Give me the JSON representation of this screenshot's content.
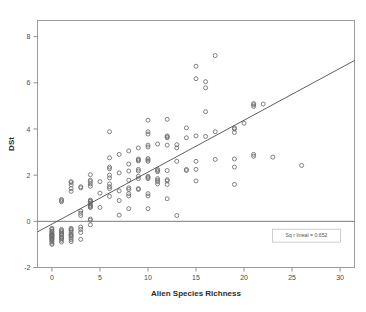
{
  "chart_data": {
    "type": "scatter",
    "title": "",
    "xlabel": "Alien Species Richness",
    "ylabel": "DSt",
    "xlim": [
      -1.5,
      31.5
    ],
    "ylim": [
      -2.0,
      8.7
    ],
    "xticks": [
      0,
      5,
      10,
      15,
      20,
      25,
      30
    ],
    "xtick_labels": [
      "0",
      "5",
      "10",
      "15",
      "20",
      "25",
      "30"
    ],
    "yticks": [
      -2,
      0,
      2,
      4,
      6,
      8
    ],
    "ytick_labels": [
      "-2",
      "0",
      "2",
      "4",
      "6",
      "8"
    ],
    "grid": false,
    "legend": "none",
    "marker": "open-circle",
    "marker_color": "#6b6b6b",
    "reference_line": {
      "orientation": "horizontal",
      "y": 0,
      "color": "#6d6d6d"
    },
    "fit_line": {
      "type": "linear",
      "label": "Sq r lineal = 0.652",
      "r_squared": 0.652,
      "intercept": -0.12,
      "slope": 0.225,
      "x_start": -1.5,
      "x_end": 31.5,
      "color": "#4d4d4d"
    },
    "annotation": {
      "text": "Sq r lineal = 0.652",
      "x": 26.5,
      "y": -0.62
    },
    "points": [
      [
        0,
        -0.35
      ],
      [
        0,
        -0.45
      ],
      [
        0,
        -0.5
      ],
      [
        0,
        -0.55
      ],
      [
        0,
        -0.6
      ],
      [
        0,
        -0.62
      ],
      [
        0,
        -0.68
      ],
      [
        0,
        -0.72
      ],
      [
        0,
        -0.78
      ],
      [
        0,
        -0.82
      ],
      [
        0,
        -0.88
      ],
      [
        0,
        -0.95
      ],
      [
        0,
        -1.0
      ],
      [
        0,
        -0.3
      ],
      [
        0,
        -0.42
      ],
      [
        0,
        -0.58
      ],
      [
        0,
        -0.65
      ],
      [
        0,
        -0.75
      ],
      [
        1,
        -0.35
      ],
      [
        1,
        -0.45
      ],
      [
        1,
        -0.52
      ],
      [
        1,
        -0.6
      ],
      [
        1,
        -0.68
      ],
      [
        1,
        -0.75
      ],
      [
        1,
        -0.82
      ],
      [
        1,
        -0.9
      ],
      [
        1,
        -0.4
      ],
      [
        1,
        -0.55
      ],
      [
        1,
        -0.7
      ],
      [
        1,
        0.9
      ],
      [
        1,
        0.95
      ],
      [
        1,
        0.85
      ],
      [
        2,
        -0.3
      ],
      [
        2,
        -0.4
      ],
      [
        2,
        -0.48
      ],
      [
        2,
        -0.56
      ],
      [
        2,
        -0.64
      ],
      [
        2,
        -0.72
      ],
      [
        2,
        -0.8
      ],
      [
        2,
        -0.88
      ],
      [
        2,
        -0.35
      ],
      [
        2,
        -0.6
      ],
      [
        2,
        1.72
      ],
      [
        2,
        1.68
      ],
      [
        2,
        1.58
      ],
      [
        2,
        1.42
      ],
      [
        2,
        1.3
      ],
      [
        3,
        -0.25
      ],
      [
        3,
        -0.35
      ],
      [
        3,
        -0.48
      ],
      [
        3,
        -0.78
      ],
      [
        3,
        0.25
      ],
      [
        3,
        0.35
      ],
      [
        3,
        0.45
      ],
      [
        3,
        1.45
      ],
      [
        3,
        1.5
      ],
      [
        4,
        -0.15
      ],
      [
        4,
        0.05
      ],
      [
        4,
        0.1
      ],
      [
        4,
        0.6
      ],
      [
        4,
        0.62
      ],
      [
        4,
        0.66
      ],
      [
        4,
        0.7
      ],
      [
        4,
        0.78
      ],
      [
        4,
        0.85
      ],
      [
        4,
        0.88
      ],
      [
        4,
        0.92
      ],
      [
        4,
        1.52
      ],
      [
        4,
        1.62
      ],
      [
        4,
        1.72
      ],
      [
        4,
        1.78
      ],
      [
        4,
        2.02
      ],
      [
        5,
        0.6
      ],
      [
        5,
        1.22
      ],
      [
        5,
        1.72
      ],
      [
        6,
        1.08
      ],
      [
        6,
        1.42
      ],
      [
        6,
        1.5
      ],
      [
        6,
        1.62
      ],
      [
        6,
        1.88
      ],
      [
        6,
        2.0
      ],
      [
        6,
        2.28
      ],
      [
        6,
        2.35
      ],
      [
        6,
        2.75
      ],
      [
        6,
        3.88
      ],
      [
        7,
        0.27
      ],
      [
        7,
        0.9
      ],
      [
        7,
        1.32
      ],
      [
        7,
        2.1
      ],
      [
        7,
        2.9
      ],
      [
        8,
        0.55
      ],
      [
        8,
        1.1
      ],
      [
        8,
        1.2
      ],
      [
        8,
        1.38
      ],
      [
        8,
        1.45
      ],
      [
        8,
        1.78
      ],
      [
        8,
        2.18
      ],
      [
        8,
        2.48
      ],
      [
        8,
        3.05
      ],
      [
        9,
        1.38
      ],
      [
        9,
        1.42
      ],
      [
        9,
        1.85
      ],
      [
        9,
        1.95
      ],
      [
        9,
        2.18
      ],
      [
        9,
        2.25
      ],
      [
        9,
        2.62
      ],
      [
        9,
        2.66
      ],
      [
        9,
        2.7
      ],
      [
        9,
        3.18
      ],
      [
        10,
        0.55
      ],
      [
        10,
        1.1
      ],
      [
        10,
        1.2
      ],
      [
        10,
        1.85
      ],
      [
        10,
        1.9
      ],
      [
        10,
        1.95
      ],
      [
        10,
        2.6
      ],
      [
        10,
        2.66
      ],
      [
        10,
        2.72
      ],
      [
        10,
        3.22
      ],
      [
        10,
        3.3
      ],
      [
        10,
        3.78
      ],
      [
        10,
        3.88
      ],
      [
        10,
        4.38
      ],
      [
        11,
        1.62
      ],
      [
        11,
        1.72
      ],
      [
        11,
        1.78
      ],
      [
        11,
        1.85
      ],
      [
        11,
        2.15
      ],
      [
        11,
        2.2
      ],
      [
        11,
        2.25
      ],
      [
        11,
        3.35
      ],
      [
        12,
        0.98
      ],
      [
        12,
        1.6
      ],
      [
        12,
        1.75
      ],
      [
        12,
        1.8
      ],
      [
        12,
        2.2
      ],
      [
        12,
        3.3
      ],
      [
        12,
        3.62
      ],
      [
        12,
        3.66
      ],
      [
        12,
        3.7
      ],
      [
        12,
        4.42
      ],
      [
        13,
        0.25
      ],
      [
        13,
        2.6
      ],
      [
        13,
        3.18
      ],
      [
        13,
        3.32
      ],
      [
        14,
        2.2
      ],
      [
        14,
        2.25
      ],
      [
        14,
        3.62
      ],
      [
        14,
        4.05
      ],
      [
        15,
        1.75
      ],
      [
        15,
        2.25
      ],
      [
        15,
        2.6
      ],
      [
        15,
        3.7
      ],
      [
        15,
        6.18
      ],
      [
        15,
        6.72
      ],
      [
        16,
        4.75
      ],
      [
        16,
        5.78
      ],
      [
        16,
        6.05
      ],
      [
        16,
        3.68
      ],
      [
        17,
        2.68
      ],
      [
        17,
        3.88
      ],
      [
        17,
        7.18
      ],
      [
        19,
        1.6
      ],
      [
        19,
        2.35
      ],
      [
        19,
        2.7
      ],
      [
        19,
        3.85
      ],
      [
        19,
        4.0
      ],
      [
        19,
        4.05
      ],
      [
        20,
        4.25
      ],
      [
        21,
        2.82
      ],
      [
        21,
        2.9
      ],
      [
        21,
        4.98
      ],
      [
        21,
        5.05
      ],
      [
        21,
        5.1
      ],
      [
        22,
        5.08
      ],
      [
        23,
        2.78
      ],
      [
        26,
        2.42
      ]
    ]
  }
}
